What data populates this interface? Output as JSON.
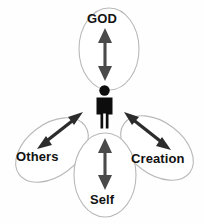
{
  "diagram": {
    "type": "radial-relationship",
    "background_color": "#fefefe",
    "center": {
      "name": "person-figure",
      "icon": "person-icon",
      "color": "#0d0d0d",
      "label": ""
    },
    "nodes": [
      {
        "id": "god",
        "label": "GOD",
        "position": "top",
        "ellipse": {
          "cx": 109,
          "cy": 49,
          "rx": 30,
          "ry": 41,
          "rotation": 0,
          "stroke_color": "#b9b9b9",
          "fill_color": "#ffffff"
        },
        "arrow": {
          "direction": "vertical",
          "double_headed": true,
          "color": "#4a4a4a"
        }
      },
      {
        "id": "others",
        "label": "Others",
        "position": "bottom-left",
        "ellipse": {
          "cx": 52,
          "cy": 150,
          "rx": 41,
          "ry": 26,
          "rotation": -37,
          "stroke_color": "#b9b9b9",
          "fill_color": "#ffffff"
        },
        "arrow": {
          "direction": "diagonal-ne-sw",
          "double_headed": true,
          "color": "#2c2c2c"
        }
      },
      {
        "id": "creation",
        "label": "Creation",
        "position": "bottom-right",
        "ellipse": {
          "cx": 157,
          "cy": 148,
          "rx": 41,
          "ry": 26,
          "rotation": 37,
          "stroke_color": "#b9b9b9",
          "fill_color": "#ffffff"
        },
        "arrow": {
          "direction": "diagonal-nw-se",
          "double_headed": true,
          "color": "#2c2c2c"
        }
      },
      {
        "id": "self",
        "label": "Self",
        "position": "bottom",
        "ellipse": {
          "cx": 105,
          "cy": 175,
          "rx": 31,
          "ry": 42,
          "rotation": 0,
          "stroke_color": "#b9b9b9",
          "fill_color": "#ffffff"
        },
        "arrow": {
          "direction": "vertical",
          "double_headed": true,
          "color": "#4a4a4a"
        }
      }
    ]
  }
}
